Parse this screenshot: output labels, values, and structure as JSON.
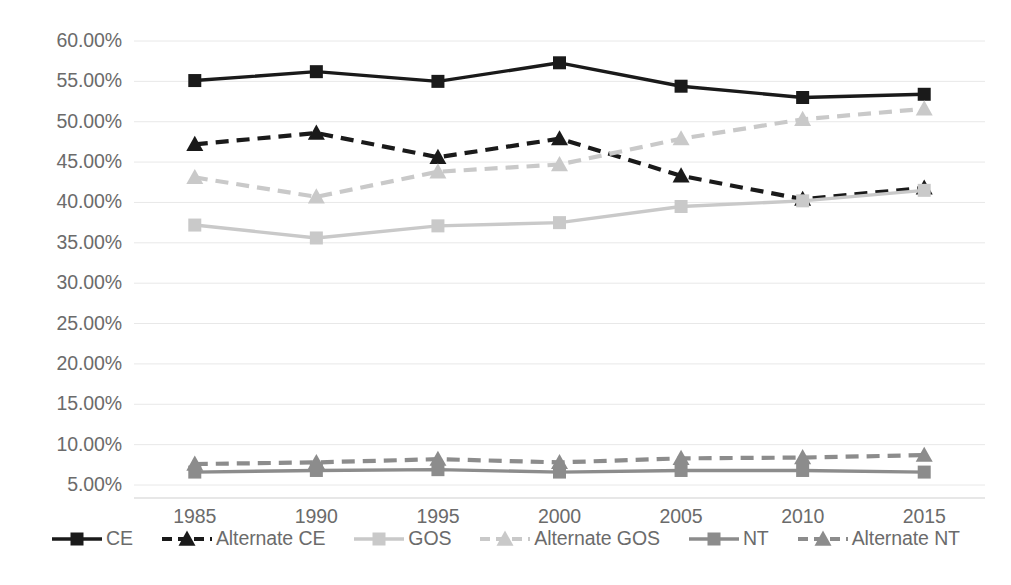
{
  "chart_data": {
    "type": "line",
    "title": "",
    "xlabel": "",
    "ylabel": "",
    "categories": [
      "1985",
      "1990",
      "1995",
      "2000",
      "2005",
      "2010",
      "2015"
    ],
    "x": [
      1985,
      1990,
      1995,
      2000,
      2005,
      2010,
      2015
    ],
    "ylim": [
      5.0,
      60.0
    ],
    "y_tick_values": [
      60.0,
      55.0,
      50.0,
      45.0,
      40.0,
      35.0,
      30.0,
      25.0,
      20.0,
      15.0,
      10.0,
      5.0
    ],
    "y_tick_labels": [
      "60.00%",
      "55.00%",
      "50.00%",
      "45.00%",
      "40.00%",
      "35.00%",
      "30.00%",
      "25.00%",
      "20.00%",
      "15.00%",
      "10.00%",
      "5.00%"
    ],
    "grid": true,
    "grid_axis": "y",
    "legend_position": "bottom",
    "value_format": "percent",
    "series": [
      {
        "name": "CE",
        "values": [
          55.1,
          56.2,
          55.0,
          57.3,
          54.4,
          53.0,
          53.4
        ],
        "color": "#1a1a1a",
        "dash": "solid",
        "marker": "square"
      },
      {
        "name": "Alternate CE",
        "values": [
          47.2,
          48.6,
          45.6,
          47.9,
          43.3,
          40.4,
          41.8
        ],
        "color": "#1a1a1a",
        "dash": "dashed",
        "marker": "triangle"
      },
      {
        "name": "GOS",
        "values": [
          37.2,
          35.6,
          37.1,
          37.5,
          39.5,
          40.2,
          41.5
        ],
        "color": "#c9c9c9",
        "dash": "solid",
        "marker": "square"
      },
      {
        "name": "Alternate GOS",
        "values": [
          43.1,
          40.7,
          43.8,
          44.7,
          47.9,
          50.3,
          51.6
        ],
        "color": "#c9c9c9",
        "dash": "dashed",
        "marker": "triangle"
      },
      {
        "name": "NT",
        "values": [
          6.6,
          6.8,
          6.9,
          6.6,
          6.8,
          6.8,
          6.6
        ],
        "color": "#8c8c8c",
        "dash": "solid",
        "marker": "square"
      },
      {
        "name": "Alternate NT",
        "values": [
          7.6,
          7.8,
          8.2,
          7.8,
          8.3,
          8.4,
          8.7
        ],
        "color": "#8c8c8c",
        "dash": "dashed",
        "marker": "triangle"
      }
    ]
  },
  "axis": {
    "tick_label_color": "#6b6b6b",
    "gridline_color": "#e8e8e8",
    "baseline_color": "#d0d0d0"
  }
}
